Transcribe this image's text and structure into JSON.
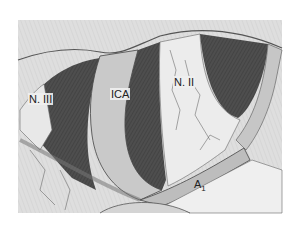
{
  "figure": {
    "type": "anatomical-illustration",
    "style": "grayscale pencil drawing",
    "colors": {
      "background": "#ffffff",
      "tissue_light": "#e4e4e4",
      "tissue_mid": "#c8c8c8",
      "dark_space": "#4a4a4a",
      "outline": "#333333",
      "vessel": "#bdbdbd"
    },
    "labels": [
      {
        "id": "n3",
        "text": "N. III",
        "x": 28,
        "y": 93
      },
      {
        "id": "ica",
        "text": "ICA",
        "x": 110,
        "y": 88
      },
      {
        "id": "n2",
        "text": "N. II",
        "x": 173,
        "y": 76
      },
      {
        "id": "a1",
        "text": "A",
        "sub": "1",
        "x": 193,
        "y": 178
      }
    ]
  }
}
